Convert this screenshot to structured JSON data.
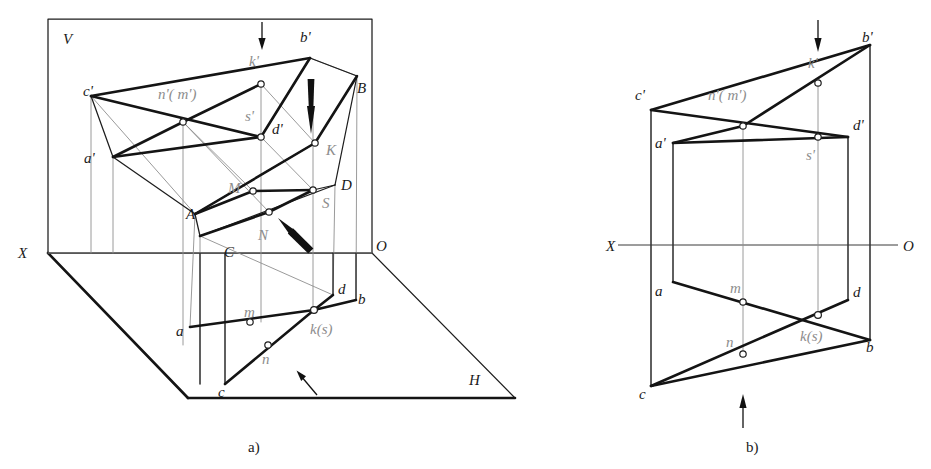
{
  "figure": {
    "captions": {
      "left": "a)",
      "right": "b)"
    }
  },
  "colors": {
    "ink": "#141414",
    "gray_label": "#8d8d8d",
    "thin_line": "#8e8e8e",
    "axis": "#3a3a3a",
    "background": "#ffffff"
  },
  "diagram_a": {
    "name": "pictorial-two-plane-model",
    "plane_labels": [
      {
        "id": "V",
        "text": "V",
        "x": 63,
        "y": 44
      },
      {
        "id": "H",
        "text": "H",
        "x": 469,
        "y": 385
      },
      {
        "id": "X",
        "text": "X",
        "x": 18,
        "y": 258
      },
      {
        "id": "O",
        "text": "O",
        "x": 376,
        "y": 251
      }
    ],
    "frontal_projection_labels": [
      {
        "id": "c-prime",
        "text": "c'",
        "x": 83,
        "y": 96,
        "style": "dark"
      },
      {
        "id": "a-prime",
        "text": "a'",
        "x": 84,
        "y": 163,
        "style": "dark"
      },
      {
        "id": "nm-prime",
        "text": "n'( m')",
        "x": 158,
        "y": 99,
        "style": "gray"
      },
      {
        "id": "k-prime",
        "text": "k'",
        "x": 249,
        "y": 66,
        "style": "gray"
      },
      {
        "id": "b-prime",
        "text": "b'",
        "x": 300,
        "y": 42,
        "style": "dark"
      },
      {
        "id": "s-prime",
        "text": "s'",
        "x": 245,
        "y": 121,
        "style": "gray"
      },
      {
        "id": "d-prime",
        "text": "d'",
        "x": 272,
        "y": 134,
        "style": "dark"
      }
    ],
    "space_point_labels": [
      {
        "id": "B",
        "text": "B",
        "x": 357,
        "y": 93,
        "style": "dark"
      },
      {
        "id": "K",
        "text": "K",
        "x": 326,
        "y": 155,
        "style": "gray"
      },
      {
        "id": "D",
        "text": "D",
        "x": 341,
        "y": 190,
        "style": "dark"
      },
      {
        "id": "S",
        "text": "S",
        "x": 322,
        "y": 208,
        "style": "gray"
      },
      {
        "id": "M",
        "text": "M",
        "x": 228,
        "y": 193,
        "style": "gray"
      },
      {
        "id": "N",
        "text": "N",
        "x": 258,
        "y": 240,
        "style": "gray"
      },
      {
        "id": "A",
        "text": "A",
        "x": 186,
        "y": 219,
        "style": "dark"
      },
      {
        "id": "C",
        "text": "C",
        "x": 224,
        "y": 257,
        "style": "dark"
      }
    ],
    "horizontal_projection_labels": [
      {
        "id": "a",
        "text": "a",
        "x": 176,
        "y": 336,
        "style": "dark"
      },
      {
        "id": "m",
        "text": "m",
        "x": 244,
        "y": 317,
        "style": "gray"
      },
      {
        "id": "n",
        "text": "n",
        "x": 262,
        "y": 364,
        "style": "gray"
      },
      {
        "id": "c",
        "text": "c",
        "x": 218,
        "y": 397,
        "style": "dark"
      },
      {
        "id": "ks",
        "text": "k(s)",
        "x": 310,
        "y": 334,
        "style": "gray"
      },
      {
        "id": "d",
        "text": "d",
        "x": 338,
        "y": 294,
        "style": "dark"
      },
      {
        "id": "b",
        "text": "b",
        "x": 358,
        "y": 304,
        "style": "dark"
      }
    ],
    "points": {
      "c_prime": [
        91,
        96
      ],
      "a_prime": [
        113,
        157
      ],
      "nm_prime": [
        183,
        122
      ],
      "k_prime": [
        261,
        84
      ],
      "b_prime": [
        310,
        58
      ],
      "d_prime": [
        261,
        137
      ],
      "B": [
        357,
        76
      ],
      "K": [
        315,
        143
      ],
      "D": [
        335,
        185
      ],
      "S": [
        313,
        190
      ],
      "M": [
        253,
        191
      ],
      "N": [
        269,
        212
      ],
      "A": [
        195,
        214
      ],
      "C": [
        200,
        236
      ],
      "a": [
        190,
        327
      ],
      "m": [
        250,
        322
      ],
      "n": [
        268,
        345
      ],
      "c": [
        225,
        384
      ],
      "ks": [
        314,
        310
      ],
      "d": [
        333,
        295
      ],
      "b": [
        356,
        300
      ]
    }
  },
  "diagram_b": {
    "name": "orthographic-two-view-epure",
    "axis_labels": [
      {
        "id": "X",
        "text": "X",
        "x": 606,
        "y": 251
      },
      {
        "id": "O",
        "text": "O",
        "x": 903,
        "y": 251
      }
    ],
    "frontal_labels": [
      {
        "id": "c-prime",
        "text": "c'",
        "x": 635,
        "y": 100,
        "style": "dark"
      },
      {
        "id": "nm-prime",
        "text": "n'( m')",
        "x": 708,
        "y": 100,
        "style": "gray"
      },
      {
        "id": "k-prime",
        "text": "k'",
        "x": 808,
        "y": 68,
        "style": "gray"
      },
      {
        "id": "b-prime",
        "text": "b'",
        "x": 862,
        "y": 42,
        "style": "dark"
      },
      {
        "id": "a-prime",
        "text": "a'",
        "x": 655,
        "y": 148,
        "style": "dark"
      },
      {
        "id": "d-prime",
        "text": "d'",
        "x": 853,
        "y": 130,
        "style": "dark"
      },
      {
        "id": "s-prime",
        "text": "s'",
        "x": 806,
        "y": 160,
        "style": "gray"
      }
    ],
    "horizontal_labels": [
      {
        "id": "a",
        "text": "a",
        "x": 655,
        "y": 296,
        "style": "dark"
      },
      {
        "id": "m",
        "text": "m",
        "x": 730,
        "y": 293,
        "style": "gray"
      },
      {
        "id": "n",
        "text": "n",
        "x": 726,
        "y": 347,
        "style": "gray"
      },
      {
        "id": "ks",
        "text": "k(s)",
        "x": 800,
        "y": 341,
        "style": "gray"
      },
      {
        "id": "d",
        "text": "d",
        "x": 853,
        "y": 297,
        "style": "dark"
      },
      {
        "id": "b",
        "text": "b",
        "x": 866,
        "y": 352,
        "style": "dark"
      },
      {
        "id": "c",
        "text": "c",
        "x": 639,
        "y": 399,
        "style": "dark"
      }
    ],
    "points": {
      "c_prime": [
        651,
        110
      ],
      "b_prime": [
        870,
        45
      ],
      "k_prime": [
        818,
        83
      ],
      "nm_prime": [
        743,
        126
      ],
      "d_prime": [
        848,
        137
      ],
      "a_prime": [
        673,
        143
      ],
      "s_prime": [
        818,
        137
      ],
      "a": [
        673,
        282
      ],
      "m": [
        743,
        302
      ],
      "ks": [
        818,
        315
      ],
      "d": [
        848,
        300
      ],
      "b": [
        870,
        340
      ],
      "n": [
        743,
        354
      ],
      "c": [
        651,
        386
      ]
    },
    "axis_y": 245
  },
  "arrows": [
    {
      "id": "arrow-top-a",
      "kind": "thin",
      "x1": 262,
      "y1": 22,
      "x2": 262,
      "y2": 48
    },
    {
      "id": "arrow-dart-a",
      "kind": "dart",
      "x1": 311,
      "y1": 79,
      "x2": 311,
      "y2": 134
    },
    {
      "id": "arrow-dart-n-a",
      "kind": "dart",
      "x1": 311,
      "y1": 251,
      "x2": 279,
      "y2": 218
    },
    {
      "id": "arrow-bottom-a",
      "kind": "thin",
      "x1": 317,
      "y1": 395,
      "x2": 297,
      "y2": 371
    },
    {
      "id": "arrow-top-b",
      "kind": "thin",
      "x1": 818,
      "y1": 20,
      "x2": 818,
      "y2": 50
    },
    {
      "id": "arrow-bottom-b",
      "kind": "thin",
      "x1": 743,
      "y1": 425,
      "x2": 743,
      "y2": 395
    }
  ]
}
